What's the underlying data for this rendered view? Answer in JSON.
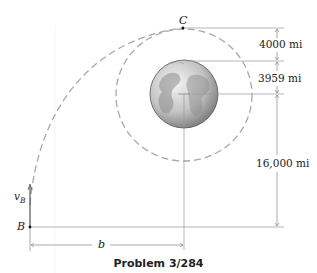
{
  "figure": {
    "title": "Problem 3/284",
    "top_cut_text": "...",
    "points": {
      "C": "C",
      "B": "B"
    },
    "velocity_label": {
      "main": "v",
      "sub": "B"
    },
    "dimensions": {
      "top_gap": "4000 mi",
      "earth_radius": "3959 mi",
      "lower_height": "16,000 mi",
      "horizontal": "b"
    },
    "objects": {
      "earth": "earth-globe",
      "inner_orbit": "circular-orbit-dashed",
      "transfer_path": "trajectory-dashed"
    },
    "colors": {
      "line": "#888888",
      "dash": "#a0a0a0",
      "text": "#222222",
      "earth_light": "#e8e8e8",
      "earth_dark": "#6e6e6e"
    }
  }
}
